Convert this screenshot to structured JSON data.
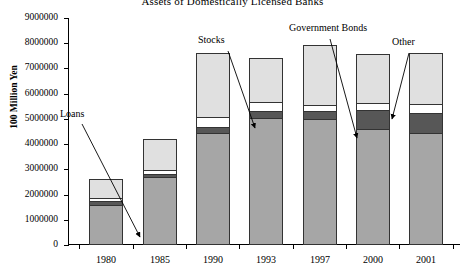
{
  "chart_data": {
    "type": "bar",
    "subtype": "stacked-vertical",
    "title": "Assets of Domestically Licensed Banks",
    "xlabel": "",
    "ylabel": "100 Million Yen",
    "categories": [
      "1980",
      "1985",
      "1990",
      "1993",
      "1997",
      "2000",
      "2001"
    ],
    "series": [
      {
        "name": "Loans",
        "color": "#a6a6a6",
        "values": [
          1580000,
          2700000,
          4430000,
          5020000,
          4980000,
          4600000,
          4430000
        ]
      },
      {
        "name": "Government Bonds",
        "color": "#575757",
        "values": [
          150000,
          130000,
          230000,
          300000,
          320000,
          750000,
          810000
        ]
      },
      {
        "name": "Other",
        "color": "#ffffff",
        "values": [
          120000,
          150000,
          420000,
          360000,
          250000,
          280000,
          370000
        ]
      },
      {
        "name": "Stocks",
        "color": "#e0e0e0",
        "values": [
          780000,
          1240000,
          2520000,
          1740000,
          2400000,
          1930000,
          1990000
        ]
      }
    ],
    "totals": [
      2630000,
      4220000,
      7600000,
      7420000,
      7950000,
      7560000,
      7600000
    ],
    "ylim": [
      0,
      9000000
    ],
    "yticks": [
      "0",
      "1000000",
      "2000000",
      "3000000",
      "4000000",
      "5000000",
      "6000000",
      "7000000",
      "8000000",
      "9000000"
    ],
    "ytick_values": [
      0,
      1000000,
      2000000,
      3000000,
      4000000,
      5000000,
      6000000,
      7000000,
      8000000,
      9000000
    ],
    "grid": false,
    "legend": "none",
    "annotations": [
      {
        "text": "Loans",
        "label_x": 60,
        "label_y": 108,
        "arrow_from_x": 82,
        "arrow_from_y": 124,
        "arrow_to_x": 140,
        "arrow_to_y": 237
      },
      {
        "text": "Stocks",
        "label_x": 198,
        "label_y": 34,
        "arrow_from_x": 228,
        "arrow_from_y": 51,
        "arrow_to_x": 255,
        "arrow_to_y": 128
      },
      {
        "text": "Government Bonds",
        "label_x": 289,
        "label_y": 22,
        "arrow_from_x": 330,
        "arrow_from_y": 39,
        "arrow_to_x": 357,
        "arrow_to_y": 138
      },
      {
        "text": "Other",
        "label_x": 392,
        "label_y": 36,
        "arrow_from_x": 409,
        "arrow_from_y": 53,
        "arrow_to_x": 392,
        "arrow_to_y": 119
      }
    ]
  }
}
